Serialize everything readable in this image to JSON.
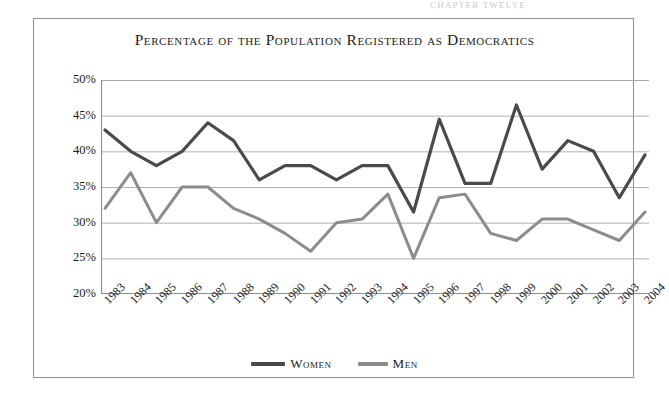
{
  "running_header": "CHAPTER  TWELVE",
  "chart_frame": {
    "title": "Percentage of the Population Registered as Democratics"
  },
  "legend": {
    "position": "bottom-center",
    "entries": [
      {
        "label": "Women",
        "color": "#4a4a4a",
        "icon": "line-swatch-icon"
      },
      {
        "label": "Men",
        "color": "#8c8c8c",
        "icon": "line-swatch-icon"
      }
    ]
  },
  "chart_data": {
    "type": "line",
    "title": "Percentage of the Population Registered as Democratics",
    "subtitle": "",
    "xlabel": "",
    "ylabel": "",
    "grid": true,
    "legend_position": "bottom",
    "ylim": [
      20,
      50
    ],
    "ytick_step": 5,
    "ytick_labels": [
      "50%",
      "45%",
      "40%",
      "35%",
      "30%",
      "25%",
      "20%"
    ],
    "ytick_values": [
      50,
      45,
      40,
      35,
      30,
      25,
      20
    ],
    "categories": [
      "1983",
      "1984",
      "1985",
      "1986",
      "1987",
      "1988",
      "1989",
      "1990",
      "1991",
      "1992",
      "1993",
      "1994",
      "1995",
      "1996",
      "1997",
      "1998",
      "1999",
      "2000",
      "2001",
      "2002",
      "2003",
      "2004"
    ],
    "series": [
      {
        "name": "Women",
        "color": "#4a4a4a",
        "line_width": 3.2,
        "values": [
          43.0,
          40.0,
          38.0,
          40.0,
          44.0,
          41.5,
          36.0,
          38.0,
          38.0,
          36.0,
          38.0,
          38.0,
          31.5,
          44.5,
          35.5,
          35.5,
          46.5,
          37.5,
          41.5,
          40.0,
          33.5,
          39.5
        ]
      },
      {
        "name": "Men",
        "color": "#8c8c8c",
        "line_width": 3.0,
        "values": [
          32.0,
          37.0,
          30.0,
          35.0,
          35.0,
          32.0,
          30.5,
          28.5,
          26.0,
          30.0,
          30.5,
          34.0,
          25.0,
          33.5,
          34.0,
          28.5,
          27.5,
          30.5,
          30.5,
          29.0,
          27.5,
          31.5
        ]
      }
    ]
  }
}
